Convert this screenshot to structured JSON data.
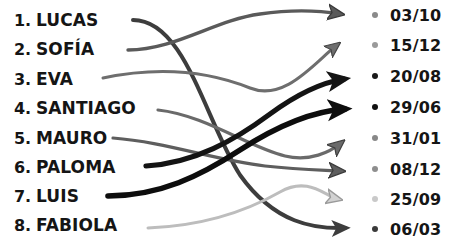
{
  "diagram": {
    "type": "matching-exercise",
    "title_visible": false,
    "left_column_label": "names",
    "right_column_label": "dates",
    "names": [
      {
        "index": "1.",
        "label": "LUCAS"
      },
      {
        "index": "2.",
        "label": "SOFÍA"
      },
      {
        "index": "3.",
        "label": "EVA"
      },
      {
        "index": "4.",
        "label": "SANTIAGO"
      },
      {
        "index": "5.",
        "label": "MAURO"
      },
      {
        "index": "6.",
        "label": "PALOMA"
      },
      {
        "index": "7.",
        "label": "LUIS"
      },
      {
        "index": "8.",
        "label": "FABIOLA"
      }
    ],
    "dates": [
      {
        "label": "03/10",
        "bullet_color": "#8a8a8a"
      },
      {
        "label": "15/12",
        "bullet_color": "#9a9a9a"
      },
      {
        "label": "20/08",
        "bullet_color": "#1a1a1a"
      },
      {
        "label": "29/06",
        "bullet_color": "#111111"
      },
      {
        "label": "31/01",
        "bullet_color": "#888888"
      },
      {
        "label": "08/12",
        "bullet_color": "#8e8e8e"
      },
      {
        "label": "25/09",
        "bullet_color": "#c9c9c9"
      },
      {
        "label": "06/03",
        "bullet_color": "#3a3a3a"
      }
    ],
    "connections": [
      {
        "from": "LUCAS",
        "from_row": 1,
        "to": "06/03",
        "to_row": 8,
        "color": "#3d3d3d",
        "width": 4.0
      },
      {
        "from": "SOFÍA",
        "from_row": 2,
        "to": "03/10",
        "to_row": 1,
        "color": "#5a5a5a",
        "width": 3.4
      },
      {
        "from": "EVA",
        "from_row": 3,
        "to": "15/12",
        "to_row": 2,
        "color": "#6e6e6e",
        "width": 3.0
      },
      {
        "from": "SANTIAGO",
        "from_row": 4,
        "to": "31/01",
        "to_row": 5,
        "color": "#6a6a6a",
        "width": 3.2
      },
      {
        "from": "MAURO",
        "from_row": 5,
        "to": "08/12",
        "to_row": 6,
        "color": "#5e5e5e",
        "width": 3.2
      },
      {
        "from": "PALOMA",
        "from_row": 6,
        "to": "20/08",
        "to_row": 3,
        "color": "#141414",
        "width": 5.2
      },
      {
        "from": "LUIS",
        "from_row": 7,
        "to": "29/06",
        "to_row": 4,
        "color": "#0d0d0d",
        "width": 5.6
      },
      {
        "from": "FABIOLA",
        "from_row": 8,
        "to": "25/09",
        "to_row": 7,
        "color": "#bdbdbd",
        "width": 3.0
      }
    ],
    "colors": {
      "text": "#151515",
      "background": "#ffffff",
      "dark_arrow": "#0d0d0d",
      "mid_arrow": "#6a6a6a",
      "light_arrow": "#bdbdbd"
    }
  }
}
